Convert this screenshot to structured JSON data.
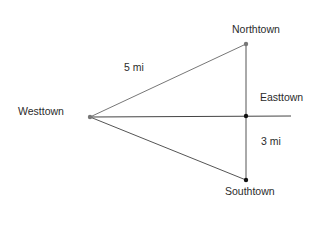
{
  "diagram": {
    "towns": [
      {
        "name": "Northtown",
        "x": 246,
        "y": 44,
        "color": "#777777"
      },
      {
        "name": "Westtown",
        "x": 90,
        "y": 117,
        "color": "#777777"
      },
      {
        "name": "Easttown",
        "x": 246,
        "y": 116,
        "color": "#111111"
      },
      {
        "name": "Southtown",
        "x": 246,
        "y": 180,
        "color": "#111111"
      }
    ],
    "labels": {
      "northtown": "Northtown",
      "westtown": "Westtown",
      "easttown": "Easttown",
      "southtown": "Southtown",
      "west_north_distance": "5 mi",
      "east_south_distance": "3 mi"
    },
    "segments": [
      {
        "from": "Westtown",
        "to": "Northtown",
        "label": "5 mi"
      },
      {
        "from": "Westtown",
        "to": "Southtown"
      },
      {
        "from": "Westtown",
        "to": "Easttown",
        "extends_to_x": 291
      },
      {
        "from": "Northtown",
        "to": "Southtown"
      },
      {
        "from": "Easttown",
        "to": "Southtown",
        "label": "3 mi"
      }
    ],
    "line_color": "#555555"
  }
}
